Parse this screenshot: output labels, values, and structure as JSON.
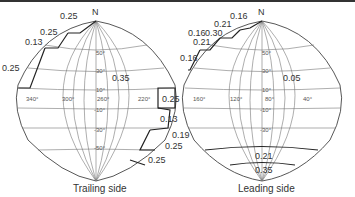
{
  "figure": {
    "north_label": "N",
    "panels": [
      {
        "id": "trailing",
        "caption": "Trailing side",
        "longitude_ticks": [
          "340°",
          "300°",
          "260°",
          "220°"
        ],
        "latitude_ticks": [
          "50°",
          "30°",
          "10°",
          "-10°",
          "-30°",
          "-50°"
        ],
        "region_values": {
          "center": "0.35",
          "nw_1": "0.25",
          "nw_2": "0.25",
          "nw_3": "0.13",
          "nw_4": "0.25",
          "e_1": "0.25",
          "e_2": "0.13",
          "se_1": "0.19",
          "se_2": "0.25",
          "se_3": "0.25"
        }
      },
      {
        "id": "leading",
        "caption": "Leading side",
        "longitude_ticks": [
          "160°",
          "120°",
          "80°",
          "40°"
        ],
        "latitude_ticks": [
          "50°",
          "30°",
          "10°",
          "-10°",
          "-30°"
        ],
        "region_values": {
          "center": "0.05",
          "nw_1": "0.16",
          "nw_2": "0.21",
          "nw_3a": "0.16",
          "nw_3b": "0.30",
          "nw_4": "0.21",
          "nw_5": "0.16",
          "south_band": "0.21",
          "south_cap": "0.35"
        }
      }
    ]
  }
}
